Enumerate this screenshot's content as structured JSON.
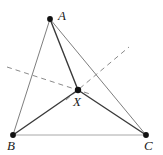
{
  "figure": {
    "kind": "geometry-diagram",
    "width": 163,
    "height": 155,
    "background_color": "#ffffff"
  },
  "colors": {
    "vertex_dot": "#111111",
    "cevian_stroke": "#3a3a3a",
    "side_stroke": "#9a9a9a",
    "side_bc_stroke": "#a8a8a8",
    "dashed_stroke": "#8a8a8a",
    "label_color": "#1a1a1a"
  },
  "points": [
    {
      "id": "A",
      "label": "A",
      "x": 50,
      "y": 19,
      "label_x": 58,
      "label_y": 9,
      "dot_radius": 2.9
    },
    {
      "id": "B",
      "label": "B",
      "x": 13,
      "y": 135,
      "label_x": 7,
      "label_y": 139,
      "dot_radius": 2.9
    },
    {
      "id": "C",
      "label": "C",
      "x": 146,
      "y": 135,
      "label_x": 144,
      "label_y": 139,
      "dot_radius": 2.9
    },
    {
      "id": "X",
      "label": "X",
      "x": 78,
      "y": 90,
      "label_x": 73,
      "label_y": 95,
      "dot_radius": 3.2
    }
  ],
  "segments": [
    {
      "id": "AB",
      "from": "A",
      "to": "B",
      "style": "solid",
      "role": "triangle-side",
      "stroke": "#7e7e7e",
      "width": 1.0
    },
    {
      "id": "AC",
      "from": "A",
      "to": "C",
      "style": "solid",
      "role": "triangle-side",
      "stroke": "#7e7e7e",
      "width": 1.0
    },
    {
      "id": "BC",
      "from": "B",
      "to": "C",
      "style": "solid",
      "role": "triangle-side",
      "stroke": "#a8a8a8",
      "width": 1.0
    },
    {
      "id": "AX",
      "from": "A",
      "to": "X",
      "style": "solid",
      "role": "cevian",
      "stroke": "#3a3a3a",
      "width": 1.4
    },
    {
      "id": "BX",
      "from": "B",
      "to": "X",
      "style": "solid",
      "role": "cevian",
      "stroke": "#3a3a3a",
      "width": 1.4
    },
    {
      "id": "CX",
      "from": "C",
      "to": "X",
      "style": "solid",
      "role": "cevian",
      "stroke": "#3a3a3a",
      "width": 1.4
    }
  ],
  "dashed_lines": [
    {
      "id": "dashed-left",
      "x1": 7,
      "y1": 67,
      "x2": 90,
      "y2": 94,
      "stroke": "#8a8a8a",
      "width": 1.0,
      "dash": "5 4",
      "role": "construction-line"
    },
    {
      "id": "dashed-right",
      "x1": 66,
      "y1": 100,
      "x2": 129,
      "y2": 47,
      "stroke": "#8a8a8a",
      "width": 1.0,
      "dash": "5 4",
      "role": "construction-line"
    }
  ]
}
